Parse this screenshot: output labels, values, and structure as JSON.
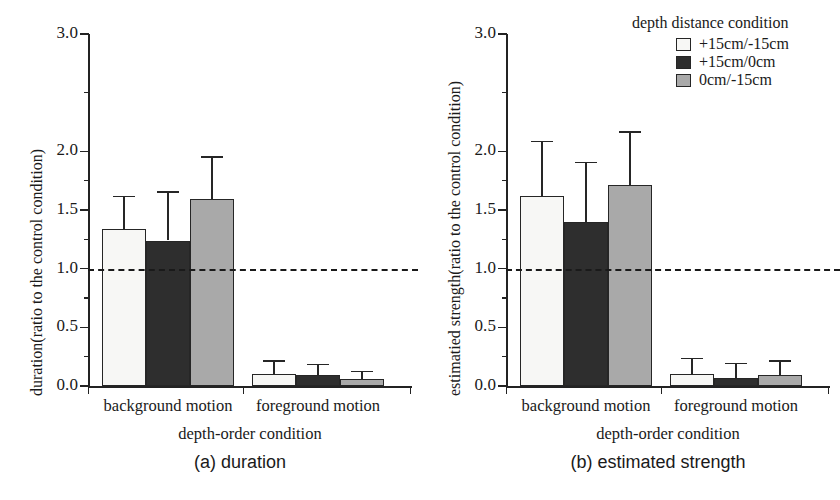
{
  "figure": {
    "width": 835,
    "height": 500,
    "background": "#ffffff"
  },
  "legend": {
    "title": "depth distance condition",
    "entries": [
      {
        "label": "+15cm/-15cm",
        "color": "#f7f7f5",
        "name": "legend-swatch-plus15-minus15"
      },
      {
        "label": "+15cm/0cm",
        "color": "#2e2e2e",
        "name": "legend-swatch-plus15-0"
      },
      {
        "label": "0cm/-15cm",
        "color": "#a9a9a9",
        "name": "legend-swatch-0-minus15"
      }
    ]
  },
  "panels": [
    {
      "id": "a",
      "caption": "(a)  duration",
      "ylabel": "duration(ratio to the control condition)",
      "xlabel": "depth-order condition"
    },
    {
      "id": "b",
      "caption": "(b)  estimated strength",
      "ylabel": "estimatied strength(ratio to the control condition)",
      "xlabel": "depth-order condition"
    }
  ],
  "chart_data": [
    {
      "type": "bar",
      "title": "(a)  duration",
      "xlabel": "depth-order condition",
      "ylabel": "duration(ratio to the control condition)",
      "ylim": [
        0.0,
        3.0
      ],
      "ytick_labels": [
        "0.0",
        "0.5",
        "1.0",
        "1.5",
        "2.0",
        "3.0"
      ],
      "ytick_values": [
        0.0,
        0.5,
        1.0,
        1.5,
        2.0,
        3.0
      ],
      "yminor_ticks": [
        0.25,
        0.75,
        1.25,
        1.75,
        2.5
      ],
      "grid": false,
      "reference_line": {
        "value": 1.0,
        "style": "dashed"
      },
      "legend_position": "upper-right-outside",
      "categories": [
        "background motion",
        "foreground motion"
      ],
      "series": [
        {
          "name": "+15cm/-15cm",
          "color": "#f7f7f5",
          "values": [
            1.34,
            0.1
          ],
          "errors_upper": [
            1.62,
            0.22
          ]
        },
        {
          "name": "+15cm/0cm",
          "color": "#2e2e2e",
          "values": [
            1.24,
            0.09
          ],
          "errors_upper": [
            1.66,
            0.19
          ]
        },
        {
          "name": "0cm/-15cm",
          "color": "#a9a9a9",
          "values": [
            1.59,
            0.06
          ],
          "errors_upper": [
            1.96,
            0.13
          ]
        }
      ]
    },
    {
      "type": "bar",
      "title": "(b)  estimated strength",
      "xlabel": "depth-order condition",
      "ylabel": "estimatied strength(ratio to the control condition)",
      "ylim": [
        0.0,
        3.0
      ],
      "ytick_labels": [
        "0.0",
        "0.5",
        "1.0",
        "1.5",
        "2.0",
        "3.0"
      ],
      "ytick_values": [
        0.0,
        0.5,
        1.0,
        1.5,
        2.0,
        3.0
      ],
      "yminor_ticks": [
        0.25,
        0.75,
        1.25,
        1.75,
        2.5
      ],
      "grid": false,
      "reference_line": {
        "value": 1.0,
        "style": "dashed"
      },
      "legend_position": "upper-right-outside",
      "categories": [
        "background motion",
        "foreground motion"
      ],
      "series": [
        {
          "name": "+15cm/-15cm",
          "color": "#f7f7f5",
          "values": [
            1.62,
            0.1
          ],
          "errors_upper": [
            2.09,
            0.24
          ]
        },
        {
          "name": "+15cm/0cm",
          "color": "#2e2e2e",
          "values": [
            1.4,
            0.07
          ],
          "errors_upper": [
            1.91,
            0.2
          ]
        },
        {
          "name": "0cm/-15cm",
          "color": "#a9a9a9",
          "values": [
            1.71,
            0.09
          ],
          "errors_upper": [
            2.17,
            0.22
          ]
        }
      ]
    }
  ]
}
